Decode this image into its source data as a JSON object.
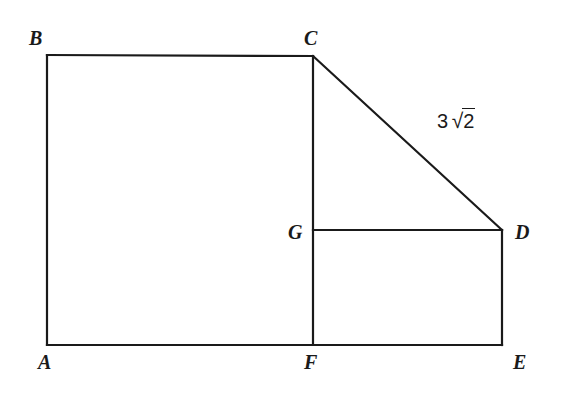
{
  "figure": {
    "background_color": "#ffffff",
    "stroke_color": "#1a1a1a",
    "stroke_width": 2.2,
    "width": 562,
    "height": 394,
    "vertices": [
      {
        "id": "A",
        "label": "A",
        "x": 47,
        "y": 345,
        "label_x": 38,
        "label_y": 352
      },
      {
        "id": "B",
        "label": "B",
        "x": 47,
        "y": 55,
        "label_x": 29,
        "label_y": 28
      },
      {
        "id": "C",
        "label": "C",
        "x": 313,
        "y": 56,
        "label_x": 304,
        "label_y": 28
      },
      {
        "id": "D",
        "label": "D",
        "x": 502,
        "y": 230,
        "label_x": 515,
        "label_y": 222
      },
      {
        "id": "E",
        "label": "E",
        "x": 502,
        "y": 345,
        "label_x": 513,
        "label_y": 352
      },
      {
        "id": "F",
        "label": "F",
        "x": 313,
        "y": 345,
        "label_x": 304,
        "label_y": 352
      },
      {
        "id": "G",
        "label": "G",
        "x": 313,
        "y": 230,
        "label_x": 288,
        "label_y": 222
      }
    ],
    "segments": [
      {
        "name": "AB",
        "from": "A",
        "to": "B"
      },
      {
        "name": "BC",
        "from": "B",
        "to": "C"
      },
      {
        "name": "CF",
        "from": "C",
        "to": "F"
      },
      {
        "name": "CD",
        "from": "C",
        "to": "D"
      },
      {
        "name": "GD",
        "from": "G",
        "to": "D"
      },
      {
        "name": "DE",
        "from": "D",
        "to": "E"
      },
      {
        "name": "AE",
        "from": "A",
        "to": "E"
      }
    ],
    "measures": [
      {
        "name": "CD-length",
        "segment": "CD",
        "coefficient": "3",
        "surd": "√",
        "radicand": "2",
        "text": "3 √2",
        "x": 437,
        "y": 108
      }
    ]
  }
}
